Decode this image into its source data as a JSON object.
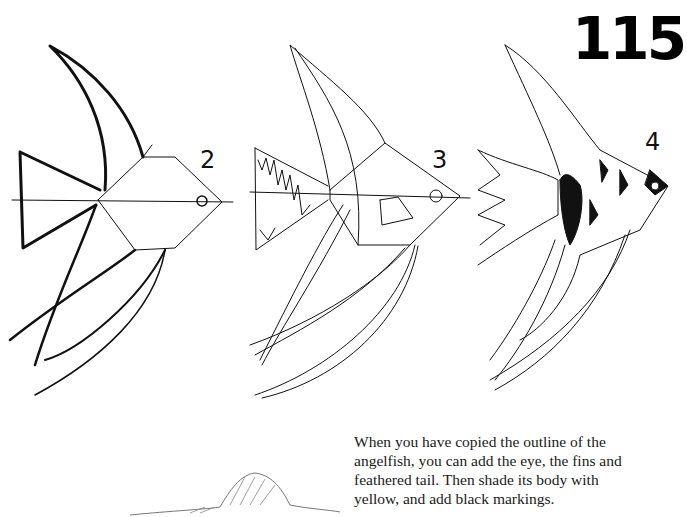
{
  "page": {
    "number": "115",
    "steps": [
      {
        "label": "2"
      },
      {
        "label": "3"
      },
      {
        "label": "4"
      }
    ],
    "caption_lines": [
      "When you have copied the outline of the",
      "angelfish, you can add the eye, the fins and",
      "feathered tail. Then shade its body with",
      "yellow, and add black markings."
    ]
  }
}
